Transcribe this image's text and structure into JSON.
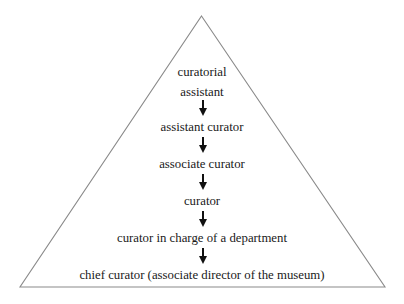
{
  "figure": {
    "shape": "triangle-pyramid",
    "background_color": "#ffffff",
    "outline_color": "#8a8a8a",
    "text_color": "#1a1a1a",
    "arrow_color": "#111111",
    "arrow_icon_name": "arrow-down-icon"
  },
  "hierarchy": {
    "levels": [
      {
        "label": "curatorial assistant",
        "line1": "curatorial",
        "line2": "assistant"
      },
      {
        "label": "assistant curator"
      },
      {
        "label": "associate curator"
      },
      {
        "label": "curator"
      },
      {
        "label": "curator in charge of a department"
      },
      {
        "label": "chief curator (associate director of the museum)"
      }
    ]
  }
}
